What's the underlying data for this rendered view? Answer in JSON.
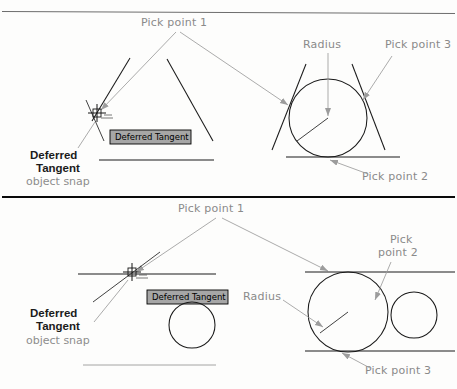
{
  "figure": {
    "title_hidden": "",
    "panels": [
      {
        "id": "top",
        "name": "tangent-tangent-radius-upper",
        "annotations": {
          "pick_point_1": "Pick point 1",
          "pick_point_2": "Pick point 2",
          "pick_point_3": "Pick point 3",
          "radius": "Radius"
        },
        "snap_label": {
          "line1": "Deferred",
          "line2": "Tangent",
          "line3": "object snap"
        },
        "tooltip": "Deferred Tangent"
      },
      {
        "id": "bottom",
        "name": "tangent-tangent-radius-lower",
        "annotations": {
          "pick_point_1": "Pick point 1",
          "pick_point_2_line1": "Pick",
          "pick_point_2_line2": "point 2",
          "pick_point_3": "Pick point 3",
          "radius": "Radius"
        },
        "snap_label": {
          "line1": "Deferred",
          "line2": "Tangent",
          "line3": "object snap"
        },
        "tooltip": "Deferred Tangent"
      }
    ],
    "colors": {
      "annotation_gray": "#8e8e8e",
      "object_black": "#1a1a1a",
      "tooltip_background": "#a6a6a6",
      "tooltip_border": "#000000",
      "page_background": "#fdfdfc"
    }
  }
}
